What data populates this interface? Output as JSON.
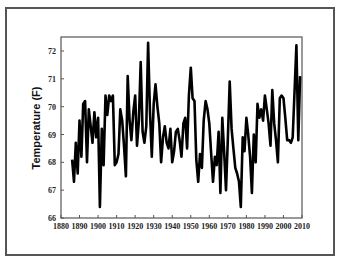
{
  "chart_data": {
    "type": "line",
    "title": "",
    "xlabel": "",
    "ylabel": "Temperature (F)",
    "xlim": [
      1880,
      2010
    ],
    "ylim": [
      66,
      72.5
    ],
    "xticks": [
      1880,
      1890,
      1900,
      1910,
      1920,
      1930,
      1940,
      1950,
      1960,
      1970,
      1980,
      1990,
      2000,
      2010
    ],
    "yticks": [
      66,
      67,
      68,
      69,
      70,
      71,
      72
    ],
    "grid": false,
    "legend": null,
    "line_color": "#000000",
    "series": [
      {
        "name": "Temperature",
        "x": [
          1886,
          1887,
          1888,
          1889,
          1890,
          1891,
          1892,
          1893,
          1894,
          1895,
          1896,
          1897,
          1898,
          1899,
          1900,
          1901,
          1902,
          1903,
          1904,
          1905,
          1906,
          1907,
          1908,
          1909,
          1910,
          1911,
          1912,
          1913,
          1914,
          1915,
          1916,
          1917,
          1918,
          1919,
          1920,
          1921,
          1922,
          1923,
          1924,
          1925,
          1926,
          1927,
          1928,
          1929,
          1930,
          1931,
          1932,
          1933,
          1934,
          1935,
          1936,
          1937,
          1938,
          1939,
          1940,
          1941,
          1942,
          1943,
          1944,
          1945,
          1946,
          1947,
          1948,
          1949,
          1950,
          1951,
          1952,
          1953,
          1954,
          1955,
          1956,
          1957,
          1958,
          1959,
          1960,
          1961,
          1962,
          1963,
          1964,
          1965,
          1966,
          1967,
          1968,
          1969,
          1970,
          1971,
          1972,
          1973,
          1974,
          1975,
          1976,
          1977,
          1978,
          1979,
          1980,
          1981,
          1982,
          1983,
          1984,
          1985,
          1986,
          1987,
          1988,
          1989,
          1990,
          1991,
          1992,
          1993,
          1994,
          1995,
          1996,
          1997,
          1998,
          1999,
          2000,
          2001,
          2002,
          2003,
          2004,
          2005,
          2006,
          2007,
          2008,
          2009
        ],
        "y": [
          68.1,
          67.3,
          68.7,
          67.6,
          69.5,
          68.2,
          70.1,
          70.2,
          68.0,
          69.9,
          69.3,
          68.7,
          69.8,
          68.9,
          69.6,
          66.4,
          69.2,
          67.9,
          70.4,
          69.7,
          70.4,
          70.2,
          70.4,
          67.9,
          68.0,
          68.3,
          69.9,
          69.5,
          68.6,
          67.5,
          71.1,
          69.5,
          68.8,
          69.8,
          70.4,
          68.6,
          69.5,
          71.6,
          69.1,
          68.7,
          69.3,
          72.3,
          69.8,
          68.2,
          70.1,
          70.8,
          70.0,
          69.4,
          68.0,
          68.9,
          69.3,
          68.7,
          68.5,
          69.2,
          68.0,
          68.4,
          69.1,
          69.2,
          68.8,
          68.2,
          69.4,
          69.6,
          68.5,
          70.4,
          71.4,
          70.3,
          70.2,
          68.1,
          67.3,
          68.3,
          67.8,
          69.5,
          70.2,
          69.9,
          69.4,
          68.3,
          67.3,
          68.2,
          67.9,
          69.1,
          66.9,
          69.6,
          68.4,
          67.0,
          68.8,
          70.9,
          69.2,
          68.5,
          67.8,
          67.6,
          67.3,
          66.4,
          68.9,
          68.4,
          69.6,
          69.0,
          68.2,
          66.9,
          69.0,
          68.0,
          70.1,
          69.6,
          69.9,
          69.5,
          70.4,
          69.9,
          69.4,
          68.6,
          70.6,
          69.4,
          68.8,
          68.0,
          70.3,
          70.4,
          70.3,
          69.6,
          68.8,
          68.8,
          68.7,
          68.9,
          70.6,
          72.2,
          68.8,
          71.1
        ]
      }
    ]
  }
}
